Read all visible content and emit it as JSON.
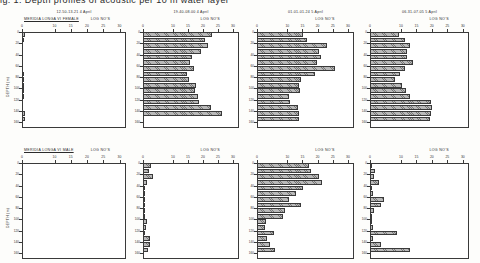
{
  "page": {
    "cut_off_line": "ig. 1. Depth profiles of acoustic per 10 m    water layer"
  },
  "axis": {
    "x_label": "LOG NO'S",
    "y_label": "DEPTH (m)",
    "x_ticks": [
      "0",
      "10",
      "15",
      "20",
      "25",
      "30"
    ],
    "x_tick_values": [
      0,
      1.0,
      1.5,
      2.0,
      2.5,
      3.0
    ],
    "x_tick_labels_decimal": [
      "0",
      "1.0",
      "1.5",
      "2.0",
      "2.5",
      "3.0"
    ],
    "y_ticks": [
      "0",
      "20",
      "40",
      "60",
      "80",
      "100",
      "120",
      "140",
      "160"
    ],
    "xlim": [
      0,
      3.2
    ],
    "ylim": [
      0,
      170
    ]
  },
  "rows": [
    {
      "species_label": "MERIDIA LONGA VI FEMALE"
    },
    {
      "species_label": "MERIDIA LONGA VI MALE"
    }
  ],
  "panels": [
    {
      "time_label": "12.50-13.21  4 April"
    },
    {
      "time_label": "19.40-08.00  4 April"
    },
    {
      "time_label": "01.01-01.24  5 April"
    },
    {
      "time_label": "06.31-07.05  5 April"
    }
  ],
  "chart_data": [
    {
      "type": "bar",
      "title": "MERIDIA LONGA VI FEMALE  —  12.50-13.21  4 April",
      "panel_row": "VI FEMALE",
      "panel_col": 1,
      "xlabel": "LOG NO'S",
      "ylabel": "DEPTH (m)",
      "xlim": [
        0,
        3.2
      ],
      "ylim": [
        0,
        170
      ],
      "grid": false,
      "orientation": "horizontal",
      "categories": [
        5,
        15,
        25,
        35,
        45,
        55,
        65,
        75,
        85,
        95,
        105,
        115,
        125,
        135,
        145,
        155,
        165
      ],
      "values": [
        0.1,
        0.04,
        0.0,
        0.0,
        0.0,
        0.0,
        0.0,
        0.05,
        0.03,
        0.07,
        0.06,
        0.05,
        0.0,
        0.0,
        0.09,
        0.1,
        0.0
      ]
    },
    {
      "type": "bar",
      "title": "MERIDIA LONGA VI FEMALE  —  19.40-08.00  4 April",
      "panel_row": "VI FEMALE",
      "panel_col": 2,
      "xlabel": "LOG NO'S",
      "ylabel": "DEPTH (m)",
      "xlim": [
        0,
        3.2
      ],
      "ylim": [
        0,
        170
      ],
      "grid": false,
      "orientation": "horizontal",
      "categories": [
        5,
        15,
        25,
        35,
        45,
        55,
        65,
        75,
        85,
        95,
        105,
        115,
        125,
        135,
        145
      ],
      "values": [
        2.3,
        2.08,
        2.18,
        1.92,
        1.62,
        1.58,
        1.7,
        1.48,
        1.52,
        1.76,
        1.74,
        1.82,
        1.86,
        2.26,
        2.62
      ]
    },
    {
      "type": "bar",
      "title": "MERIDIA LONGA VI FEMALE  —  01.01-01.24  5 April",
      "panel_row": "VI FEMALE",
      "panel_col": 3,
      "xlabel": "LOG NO'S",
      "ylabel": "DEPTH (m)",
      "xlim": [
        0,
        3.2
      ],
      "ylim": [
        0,
        170
      ],
      "grid": false,
      "orientation": "horizontal",
      "categories": [
        5,
        15,
        25,
        35,
        45,
        55,
        65,
        75,
        85,
        95,
        105,
        115,
        125,
        135,
        145,
        155
      ],
      "values": [
        1.52,
        1.66,
        2.32,
        2.04,
        2.1,
        1.98,
        2.56,
        1.9,
        1.44,
        1.4,
        1.42,
        1.06,
        1.1,
        1.34,
        1.38,
        1.4
      ]
    },
    {
      "type": "bar",
      "title": "MERIDIA LONGA VI FEMALE  —  06.31-07.05  5 April",
      "panel_row": "VI FEMALE",
      "panel_col": 4,
      "xlabel": "LOG NO'S",
      "ylabel": "DEPTH (m)",
      "xlim": [
        0,
        3.2
      ],
      "ylim": [
        0,
        170
      ],
      "grid": false,
      "orientation": "horizontal",
      "categories": [
        5,
        15,
        25,
        35,
        45,
        55,
        65,
        75,
        85,
        95,
        105,
        115,
        125,
        135,
        145,
        155
      ],
      "values": [
        0.94,
        1.12,
        1.3,
        1.2,
        1.18,
        1.4,
        1.14,
        0.96,
        0.8,
        1.02,
        1.16,
        1.3,
        1.98,
        2.02,
        1.96,
        1.94
      ]
    },
    {
      "type": "bar",
      "title": "MERIDIA LONGA VI MALE  —  12.50-13.21  4 April",
      "panel_row": "VI MALE",
      "panel_col": 1,
      "xlabel": "LOG NO'S",
      "ylabel": "DEPTH (m)",
      "xlim": [
        0,
        3.2
      ],
      "ylim": [
        0,
        170
      ],
      "grid": false,
      "orientation": "horizontal",
      "categories": [
        5,
        15,
        25,
        35,
        45,
        55,
        65,
        75,
        85,
        95,
        105,
        115,
        125,
        135,
        145,
        155,
        165
      ],
      "values": [
        0,
        0,
        0,
        0,
        0,
        0,
        0,
        0,
        0,
        0,
        0,
        0,
        0,
        0,
        0,
        0,
        0
      ]
    },
    {
      "type": "bar",
      "title": "MERIDIA LONGA VI MALE  —  19.40-08.00  4 April",
      "panel_row": "VI MALE",
      "panel_col": 2,
      "xlabel": "LOG NO'S",
      "ylabel": "DEPTH (m)",
      "xlim": [
        0,
        3.2
      ],
      "ylim": [
        0,
        170
      ],
      "grid": false,
      "orientation": "horizontal",
      "categories": [
        5,
        15,
        25,
        35,
        45,
        55,
        65,
        75,
        85,
        95,
        105,
        115,
        125,
        135,
        145,
        155
      ],
      "values": [
        0.26,
        0.2,
        0.34,
        0.14,
        0.06,
        0.04,
        0.05,
        0.04,
        0.05,
        0.07,
        0.13,
        0.09,
        0.05,
        0.22,
        0.24,
        0.16
      ]
    },
    {
      "type": "bar",
      "title": "MERIDIA LONGA VI MALE  —  01.01-01.24  5 April",
      "panel_row": "VI MALE",
      "panel_col": 3,
      "xlabel": "LOG NO'S",
      "ylabel": "DEPTH (m)",
      "xlim": [
        0,
        3.2
      ],
      "ylim": [
        0,
        170
      ],
      "grid": false,
      "orientation": "horizontal",
      "categories": [
        5,
        15,
        25,
        35,
        45,
        55,
        65,
        75,
        85,
        95,
        105,
        115,
        125,
        135,
        145,
        155
      ],
      "values": [
        1.7,
        1.78,
        2.06,
        2.14,
        1.52,
        1.3,
        1.06,
        1.46,
        0.92,
        0.86,
        0.3,
        0.26,
        0.56,
        0.34,
        0.44,
        0.6
      ]
    },
    {
      "type": "bar",
      "title": "MERIDIA LONGA VI MALE  —  06.31-07.05  5 April",
      "panel_row": "VI MALE",
      "panel_col": 4,
      "xlabel": "LOG NO'S",
      "ylabel": "DEPTH (m)",
      "xlim": [
        0,
        3.2
      ],
      "ylim": [
        0,
        170
      ],
      "grid": false,
      "orientation": "horizontal",
      "categories": [
        5,
        15,
        25,
        35,
        45,
        55,
        65,
        75,
        85,
        95,
        105,
        115,
        125,
        135,
        145,
        155
      ],
      "values": [
        0.06,
        0.16,
        0.14,
        0.28,
        0.04,
        0.1,
        0.46,
        0.34,
        0.12,
        0.08,
        0.06,
        0.1,
        0.86,
        0.1,
        0.36,
        1.28
      ]
    }
  ]
}
